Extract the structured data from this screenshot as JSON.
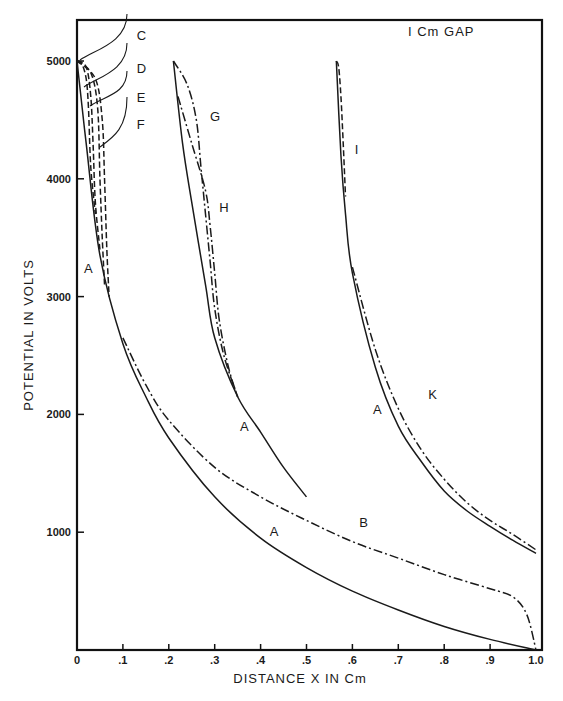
{
  "chart_data": {
    "type": "line",
    "title": "",
    "annotation": "I Cm GAP",
    "xlabel": "DISTANCE  X  IN  Cm",
    "ylabel": "POTENTIAL  IN  VOLTS",
    "xlim": [
      0,
      1.0
    ],
    "ylim": [
      0,
      5000
    ],
    "grid": false,
    "legend": "inline curve labels",
    "x_ticks": [
      "0",
      ".1",
      ".2",
      ".3",
      ".4",
      ".5",
      ".6",
      ".7",
      ".8",
      ".9",
      "1.0"
    ],
    "x_tick_values": [
      0,
      0.1,
      0.2,
      0.3,
      0.4,
      0.5,
      0.6,
      0.7,
      0.8,
      0.9,
      1.0
    ],
    "y_ticks": [
      "1000",
      "2000",
      "3000",
      "4000",
      "5000"
    ],
    "y_tick_values": [
      1000,
      2000,
      3000,
      4000,
      5000
    ],
    "series": [
      {
        "name": "A",
        "style": "solid",
        "x": [
          0,
          0.02,
          0.05,
          0.1,
          0.15,
          0.2,
          0.3,
          0.4,
          0.5,
          0.6,
          0.7,
          0.8,
          0.9,
          1.0
        ],
        "values": [
          5000,
          4300,
          3350,
          2600,
          2150,
          1800,
          1300,
          950,
          700,
          500,
          340,
          200,
          90,
          0
        ]
      },
      {
        "name": "B",
        "style": "dash-dot",
        "x": [
          0.1,
          0.15,
          0.2,
          0.3,
          0.4,
          0.5,
          0.6,
          0.7,
          0.8,
          0.9,
          0.95,
          0.98,
          1.0
        ],
        "values": [
          2650,
          2250,
          1950,
          1550,
          1300,
          1100,
          920,
          780,
          640,
          520,
          450,
          300,
          0
        ]
      },
      {
        "name": "C",
        "style": "dashed",
        "x": [
          0,
          0.01,
          0.02,
          0.025,
          0.03,
          0.04
        ],
        "values": [
          5000,
          4980,
          4850,
          4600,
          4100,
          3700
        ]
      },
      {
        "name": "D",
        "style": "dashed",
        "x": [
          0,
          0.02,
          0.03,
          0.035,
          0.04,
          0.05
        ],
        "values": [
          5000,
          4950,
          4700,
          4300,
          3800,
          3400
        ]
      },
      {
        "name": "E",
        "style": "dashed",
        "x": [
          0,
          0.03,
          0.045,
          0.05,
          0.055,
          0.06
        ],
        "values": [
          5000,
          4900,
          4600,
          4000,
          3500,
          3100
        ]
      },
      {
        "name": "F",
        "style": "dashed",
        "x": [
          0,
          0.04,
          0.055,
          0.06,
          0.065,
          0.07
        ],
        "values": [
          5000,
          4850,
          4500,
          4000,
          3400,
          3000
        ]
      },
      {
        "name": "A (0.2 cm start)",
        "style": "solid",
        "x": [
          0.21,
          0.23,
          0.25,
          0.28,
          0.3,
          0.35,
          0.4,
          0.45,
          0.5
        ],
        "values": [
          5000,
          4300,
          3800,
          3100,
          2650,
          2150,
          1850,
          1550,
          1300
        ]
      },
      {
        "name": "G",
        "style": "dash-dot",
        "x": [
          0.21,
          0.24,
          0.26,
          0.27,
          0.28,
          0.29,
          0.3,
          0.32,
          0.35
        ],
        "values": [
          5000,
          4800,
          4500,
          4100,
          3700,
          3300,
          2900,
          2500,
          2150
        ]
      },
      {
        "name": "H",
        "style": "dash-dot",
        "x": [
          0.22,
          0.25,
          0.28,
          0.29,
          0.3,
          0.31,
          0.33,
          0.35
        ],
        "values": [
          4700,
          4300,
          3900,
          3600,
          3200,
          2800,
          2400,
          2150
        ]
      },
      {
        "name": "A (0.57 cm start)",
        "style": "solid",
        "x": [
          0.565,
          0.575,
          0.585,
          0.6,
          0.65,
          0.7,
          0.75,
          0.8,
          0.85,
          0.9,
          0.95,
          1.0
        ],
        "values": [
          5000,
          4200,
          3700,
          3200,
          2400,
          1900,
          1600,
          1350,
          1180,
          1050,
          930,
          820
        ]
      },
      {
        "name": "I",
        "style": "dashed",
        "x": [
          0.565,
          0.57,
          0.575,
          0.58,
          0.585
        ],
        "values": [
          5000,
          4950,
          4700,
          4300,
          3850
        ]
      },
      {
        "name": "K",
        "style": "dash-dot",
        "x": [
          0.6,
          0.65,
          0.7,
          0.75,
          0.8,
          0.85,
          0.9,
          0.95,
          1.0
        ],
        "values": [
          3250,
          2550,
          2050,
          1700,
          1450,
          1250,
          1100,
          980,
          850
        ]
      }
    ],
    "curve_labels": [
      {
        "text": "C",
        "x": 0.13,
        "y": 5180
      },
      {
        "text": "D",
        "x": 0.13,
        "y": 4900
      },
      {
        "text": "E",
        "x": 0.13,
        "y": 4650
      },
      {
        "text": "F",
        "x": 0.13,
        "y": 4420
      },
      {
        "text": "A",
        "x": 0.015,
        "y": 3200
      },
      {
        "text": "G",
        "x": 0.29,
        "y": 4490
      },
      {
        "text": "H",
        "x": 0.31,
        "y": 3720
      },
      {
        "text": "A",
        "x": 0.355,
        "y": 1860
      },
      {
        "text": "I",
        "x": 0.605,
        "y": 4210
      },
      {
        "text": "A",
        "x": 0.645,
        "y": 2000
      },
      {
        "text": "K",
        "x": 0.765,
        "y": 2130
      },
      {
        "text": "B",
        "x": 0.615,
        "y": 1040
      },
      {
        "text": "A",
        "x": 0.42,
        "y": 970
      }
    ]
  }
}
